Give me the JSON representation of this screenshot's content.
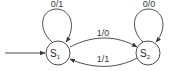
{
  "diagram": {
    "type": "finite-state-machine",
    "states": [
      {
        "id": "S1",
        "label": "S",
        "subscript": "1",
        "initial": true
      },
      {
        "id": "S2",
        "label": "S",
        "subscript": "2",
        "initial": false
      }
    ],
    "transitions": [
      {
        "from": "S1",
        "to": "S1",
        "label": "0/1"
      },
      {
        "from": "S1",
        "to": "S2",
        "label": "1/0"
      },
      {
        "from": "S2",
        "to": "S1",
        "label": "1/1"
      },
      {
        "from": "S2",
        "to": "S2",
        "label": "0/0"
      }
    ],
    "colors": {
      "stroke": "#3a3a3a",
      "background": "#ffffff"
    }
  }
}
